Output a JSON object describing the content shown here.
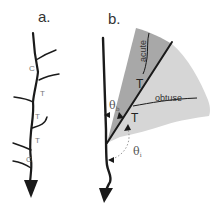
{
  "panels": {
    "a": {
      "label": "a.",
      "junction_labels": [
        "C",
        "T",
        "T",
        "T",
        "C"
      ]
    },
    "b": {
      "label": "b.",
      "regions": {
        "acute": "acute",
        "obtuse": "obtuse"
      },
      "branch_labels": [
        "T",
        "T"
      ],
      "angles": {
        "theta_b": "θ",
        "theta_b_sub": "b",
        "theta_i": "θ",
        "theta_i_sub": "i"
      }
    }
  },
  "colors": {
    "stroke": "#1a1a1a",
    "acute_fill": "#a8a8a8",
    "obtuse_fill": "#d6d6d6",
    "label": "#333333",
    "dotted": "#999999"
  }
}
